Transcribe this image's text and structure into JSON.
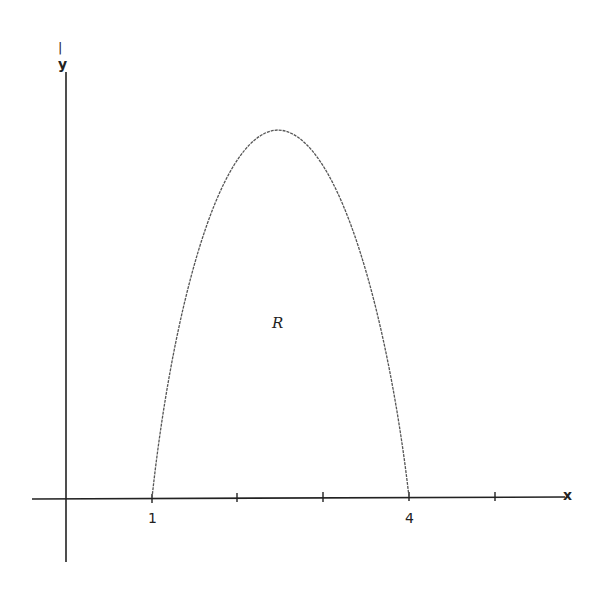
{
  "diagram": {
    "type": "function-graph",
    "axes": {
      "x_label": "x",
      "y_label": "y",
      "x_tick_labels": [
        "1",
        "4"
      ],
      "tick_count": 5
    },
    "region_label": "R",
    "curve": {
      "roots": [
        1,
        4
      ],
      "shape": "concave down"
    },
    "colors": {
      "axes": "#222222",
      "curve": "#555555",
      "background": "#ffffff"
    }
  }
}
